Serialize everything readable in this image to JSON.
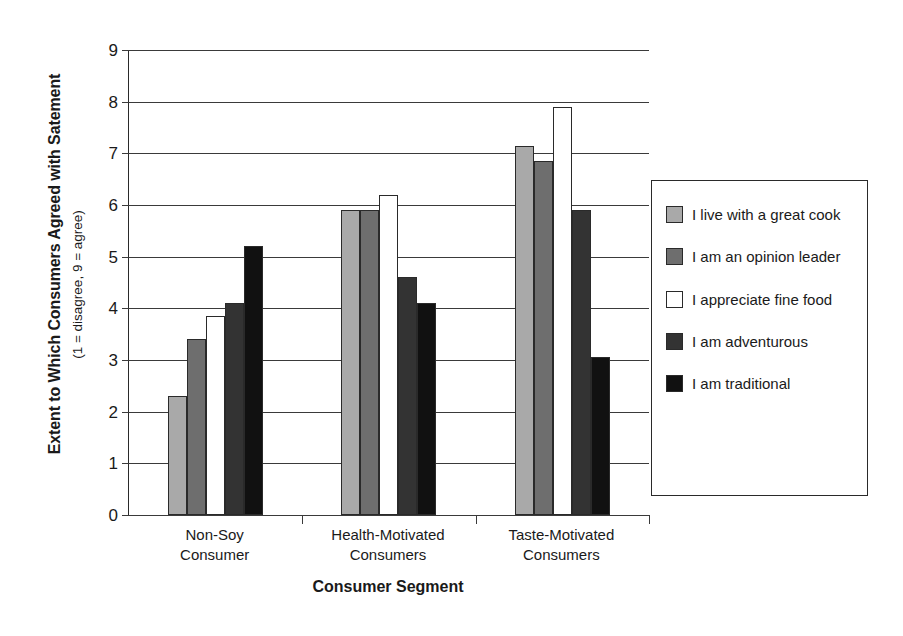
{
  "chart_data": {
    "type": "bar",
    "title": "",
    "xlabel": "Consumer Segment",
    "ylabel": "Extent to Which Consumers Agreed with Satement",
    "ylabel_sub": "(1 = disagree, 9 = agree)",
    "categories": [
      "Non-Soy\nConsumer",
      "Health-Motivated\nConsumers",
      "Taste-Motivated\nConsumers"
    ],
    "category_lines": [
      [
        "Non-Soy",
        "Consumer"
      ],
      [
        "Health-Motivated",
        "Consumers"
      ],
      [
        "Taste-Motivated",
        "Consumers"
      ]
    ],
    "ylim": [
      0,
      9
    ],
    "yticks": [
      0,
      1,
      2,
      3,
      4,
      5,
      6,
      7,
      8,
      9
    ],
    "grid": true,
    "legend_position": "right",
    "series": [
      {
        "name": "I live with a great cook",
        "color": "#a9a9a9",
        "values": [
          2.3,
          5.9,
          7.15
        ]
      },
      {
        "name": "I am an opinion leader",
        "color": "#6e6e6e",
        "values": [
          3.4,
          5.9,
          6.85
        ]
      },
      {
        "name": "I appreciate fine food",
        "color": "#ffffff",
        "values": [
          3.85,
          6.2,
          7.9
        ]
      },
      {
        "name": "I am adventurous",
        "color": "#333333",
        "values": [
          4.1,
          4.6,
          5.9
        ]
      },
      {
        "name": "I am traditional",
        "color": "#111111",
        "values": [
          5.2,
          4.1,
          3.05
        ]
      }
    ]
  },
  "legend": {
    "items": [
      {
        "label": "I live with a great cook",
        "swatch": "light-gray"
      },
      {
        "label": "I am an opinion leader",
        "swatch": "medium-gray"
      },
      {
        "label": "I appreciate fine food",
        "swatch": "white"
      },
      {
        "label": "I am adventurous",
        "swatch": "dark-gray"
      },
      {
        "label": "I am traditional",
        "swatch": "black"
      }
    ]
  }
}
